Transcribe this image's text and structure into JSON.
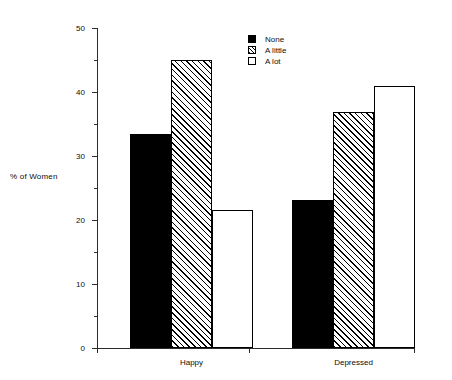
{
  "chart_data": {
    "type": "bar",
    "title": "",
    "xlabel": "",
    "ylabel": "% of Women",
    "categories": [
      "Happy",
      "Depressed"
    ],
    "series": [
      {
        "name": "None",
        "values": [
          33.5,
          23.2
        ]
      },
      {
        "name": "A little",
        "values": [
          45.0,
          36.8
        ]
      },
      {
        "name": "A lot",
        "values": [
          21.5,
          40.9
        ]
      }
    ],
    "ylim": [
      0,
      50
    ],
    "yticks": [
      0,
      10,
      20,
      30,
      40,
      50
    ],
    "ytick_labels": [
      "0",
      "10",
      "20",
      "30",
      "40",
      "50"
    ],
    "yminor_ticks": [
      5,
      15,
      25,
      35,
      45
    ],
    "grid": false,
    "legend_position": "top-right",
    "legend_entries": [
      "None",
      "A little",
      "A lot"
    ],
    "series_fills": [
      "solid-black",
      "diagonal-hatch",
      "white"
    ]
  },
  "legend": {
    "items": [
      {
        "label": "None",
        "swatch": "solid-black-swatch"
      },
      {
        "label": "A little",
        "swatch": "hatched-swatch"
      },
      {
        "label": "A lot",
        "swatch": "white-swatch"
      }
    ]
  },
  "axes": {
    "y_title": "% of Women"
  },
  "colors": {
    "ink": "#000000",
    "axis": "#2b2b2b",
    "background": "#ffffff"
  }
}
